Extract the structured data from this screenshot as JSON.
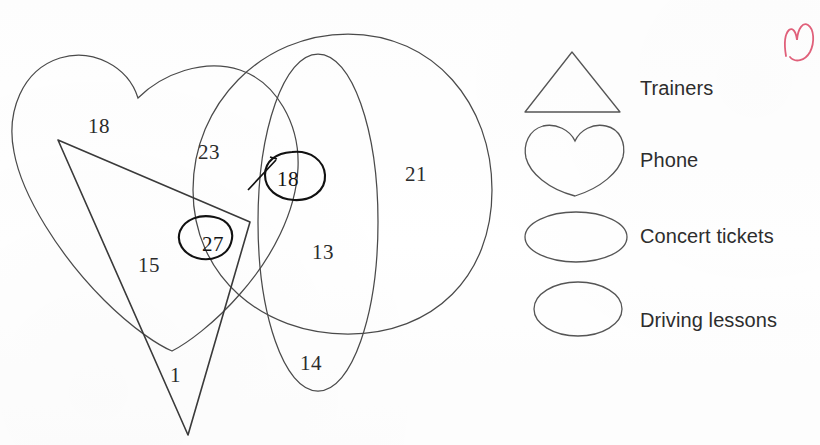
{
  "diagram": {
    "type": "venn-diagram",
    "title_visible": false,
    "regions": [
      {
        "id": "phone-only",
        "value": "18",
        "x": 88,
        "y": 114,
        "circled": false
      },
      {
        "id": "phone-driving",
        "value": "23",
        "x": 198,
        "y": 140,
        "circled": false
      },
      {
        "id": "phone-driving-concert",
        "value": "18",
        "x": 277,
        "y": 167,
        "circled": true
      },
      {
        "id": "driving-only",
        "value": "21",
        "x": 405,
        "y": 162,
        "circled": false
      },
      {
        "id": "phone-trainers",
        "value": "15",
        "x": 138,
        "y": 253,
        "circled": false
      },
      {
        "id": "phone-trainers-driving",
        "value": "27",
        "x": 202,
        "y": 232,
        "circled": true
      },
      {
        "id": "driving-concert",
        "value": "13",
        "x": 312,
        "y": 240,
        "circled": false
      },
      {
        "id": "concert-only",
        "value": "14",
        "x": 300,
        "y": 351,
        "circled": false
      },
      {
        "id": "trainers-only",
        "value": "1",
        "x": 170,
        "y": 363,
        "circled": false
      }
    ],
    "shapes": [
      {
        "id": "phone-heart",
        "shape": "heart",
        "set": "Phone"
      },
      {
        "id": "driving-circle",
        "shape": "circle",
        "set": "Driving lessons"
      },
      {
        "id": "concert-ellipse",
        "shape": "ellipse",
        "set": "Concert tickets"
      },
      {
        "id": "trainers-triangle",
        "shape": "triangle",
        "set": "Trainers"
      }
    ],
    "annotation_color": "#111111",
    "line_color": "#4a4a4a",
    "red_mark_color": "#e0607a"
  },
  "legend": {
    "items": [
      {
        "icon": "triangle-icon",
        "label": "Trainers",
        "label_x": 640,
        "label_y": 77
      },
      {
        "icon": "heart-icon",
        "label": "Phone",
        "label_x": 640,
        "label_y": 149
      },
      {
        "icon": "flat-ellipse-icon",
        "label": "Concert tickets",
        "label_x": 640,
        "label_y": 225
      },
      {
        "icon": "round-ellipse-icon",
        "label": "Driving lessons",
        "label_x": 640,
        "label_y": 309
      }
    ]
  },
  "marks": {
    "red_scribble": {
      "name": "red-pen-scribble",
      "x": 778,
      "y": 14
    }
  }
}
